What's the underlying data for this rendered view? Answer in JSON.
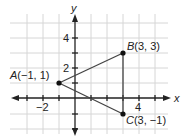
{
  "diagram": {
    "type": "coordinate-plane-triangle",
    "axes": {
      "x_label": "x",
      "y_label": "y",
      "x_ticks": [
        {
          "value": -2,
          "label": "−2"
        },
        {
          "value": 4,
          "label": "4"
        }
      ],
      "y_ticks": [
        {
          "value": 2,
          "label": "2"
        },
        {
          "value": 4,
          "label": "4"
        }
      ],
      "x_range": [
        -4,
        5
      ],
      "y_range": [
        -2,
        5
      ]
    },
    "grid": true,
    "points": [
      {
        "name": "A",
        "coords": "(−1, 1)",
        "x": -1,
        "y": 1
      },
      {
        "name": "B",
        "coords": "(3, 3)",
        "x": 3,
        "y": 3
      },
      {
        "name": "C",
        "coords": "(3, −1)",
        "x": 3,
        "y": -1
      }
    ],
    "segments": [
      [
        "A",
        "B"
      ],
      [
        "B",
        "C"
      ],
      [
        "A",
        "C"
      ]
    ],
    "colors": {
      "grid": "#d6d6d6",
      "axis": "#222222",
      "shape": "#444444",
      "point": "#111111"
    }
  }
}
